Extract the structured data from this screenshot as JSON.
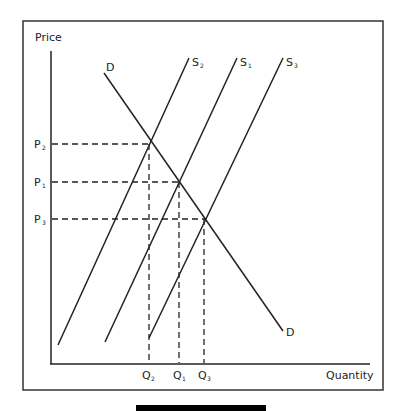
{
  "diagram": {
    "axes": {
      "y_label": "Price",
      "x_label": "Quantity"
    },
    "curves": {
      "demand": {
        "top_label": "D",
        "bottom_label": "D"
      },
      "supply": [
        {
          "id": "S2",
          "label": "S",
          "sub": "2"
        },
        {
          "id": "S1",
          "label": "S",
          "sub": "1"
        },
        {
          "id": "S3",
          "label": "S",
          "sub": "3"
        }
      ]
    },
    "price_levels": [
      {
        "id": "P2",
        "label": "P",
        "sub": "2"
      },
      {
        "id": "P1",
        "label": "P",
        "sub": "1"
      },
      {
        "id": "P3",
        "label": "P",
        "sub": "3"
      }
    ],
    "quantity_levels": [
      {
        "id": "Q2",
        "label": "Q",
        "sub": "2"
      },
      {
        "id": "Q1",
        "label": "Q",
        "sub": "1"
      },
      {
        "id": "Q3",
        "label": "Q",
        "sub": "3"
      }
    ],
    "colors": {
      "line": "#222222",
      "frame": "#333333",
      "bar": "#000000"
    }
  }
}
